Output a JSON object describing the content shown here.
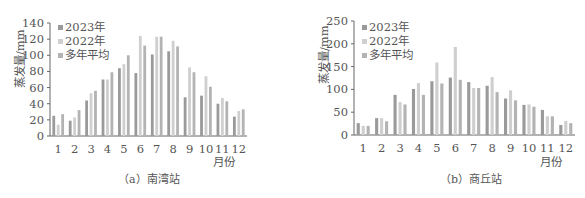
{
  "colors": {
    "s2023": "#9a9a9a",
    "s2022": "#cfcfcf",
    "avg": "#b3b3b3",
    "axis": "#666666"
  },
  "chart_data": [
    {
      "type": "bar",
      "title": "(a) 南湾站",
      "xlabel": "月份",
      "ylabel": "蒸发量/mm",
      "categories": [
        "1",
        "2",
        "3",
        "4",
        "5",
        "6",
        "7",
        "8",
        "9",
        "10",
        "11",
        "12"
      ],
      "ylim": [
        0,
        140
      ],
      "yticks": [
        0,
        20,
        40,
        60,
        80,
        100,
        120,
        140
      ],
      "grid": false,
      "legend_position": "top-left",
      "series": [
        {
          "name": "2023年",
          "values": [
            25,
            19,
            44,
            70,
            84,
            78,
            101,
            105,
            48,
            50,
            40,
            24
          ]
        },
        {
          "name": "2022年",
          "values": [
            14,
            23,
            53,
            70,
            89,
            124,
            123,
            118,
            85,
            74,
            47,
            31
          ]
        },
        {
          "name": "多年平均",
          "values": [
            27,
            32,
            56,
            79,
            100,
            112,
            123,
            111,
            79,
            61,
            43,
            33
          ]
        }
      ]
    },
    {
      "type": "bar",
      "title": "(b) 商丘站",
      "xlabel": "月份",
      "ylabel": "蒸发量/mm",
      "categories": [
        "1",
        "2",
        "3",
        "4",
        "5",
        "6",
        "7",
        "8",
        "9",
        "10",
        "11",
        "12"
      ],
      "ylim": [
        0,
        250
      ],
      "yticks": [
        0,
        50,
        100,
        150,
        200,
        250
      ],
      "grid": false,
      "legend_position": "top-left",
      "series": [
        {
          "name": "2023年",
          "values": [
            26,
            37,
            88,
            101,
            118,
            126,
            116,
            108,
            80,
            66,
            55,
            22
          ]
        },
        {
          "name": "2022年",
          "values": [
            20,
            37,
            72,
            114,
            159,
            193,
            103,
            127,
            98,
            67,
            41,
            31
          ]
        },
        {
          "name": "多年平均",
          "values": [
            20,
            30,
            67,
            88,
            113,
            121,
            103,
            94,
            76,
            62,
            41,
            26
          ]
        }
      ]
    }
  ],
  "panels": [
    {
      "caption": "（a）南湾站",
      "ylabel": "蒸发量/mm",
      "xunit": "月份",
      "legend": [
        "2023年",
        "2022年",
        "多年平均"
      ]
    },
    {
      "caption": "（b）商丘站",
      "ylabel": "蒸发量/mm",
      "xunit": "月份",
      "legend": [
        "2023年",
        "2022年",
        "多年平均"
      ]
    }
  ]
}
